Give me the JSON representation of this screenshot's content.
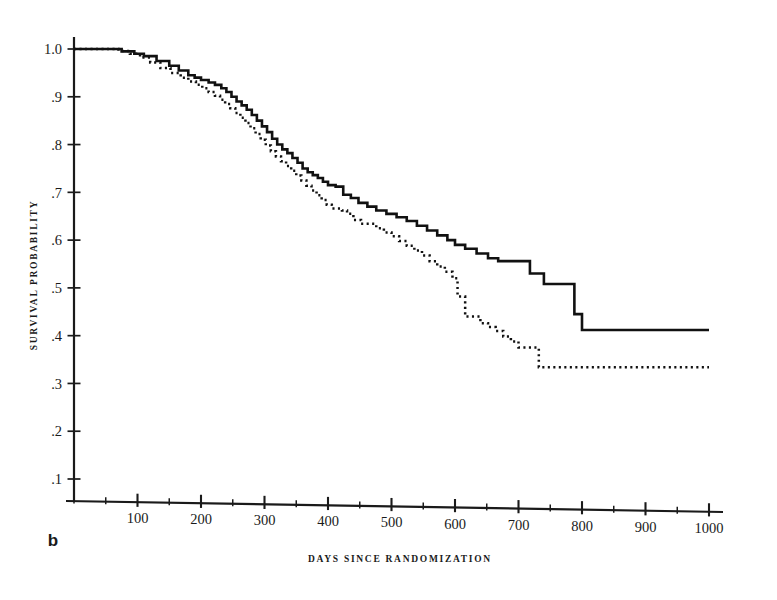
{
  "figure": {
    "panel_label": "b",
    "background_color": "#ffffff",
    "ink_color": "#1a1a1a"
  },
  "chart_data": {
    "type": "line",
    "title": "",
    "subtitle": "",
    "xlabel": "DAYS SINCE RANDOMIZATION",
    "ylabel": "SURVIVAL PROBABILITY",
    "xlim": [
      0,
      1000
    ],
    "ylim": [
      0.0,
      1.02
    ],
    "grid": false,
    "legend_position": "none",
    "plot_style": "kaplan-meier step curves, no top or right frame",
    "xticks": [
      0,
      50,
      100,
      150,
      200,
      250,
      300,
      350,
      400,
      450,
      500,
      550,
      600,
      650,
      700,
      750,
      800,
      850,
      900,
      950,
      1000
    ],
    "xtick_labels": [
      "",
      "",
      "100",
      "",
      "200",
      "",
      "300",
      "",
      "400",
      "",
      "500",
      "",
      "600",
      "",
      "700",
      "",
      "800",
      "",
      "900",
      "",
      "1000"
    ],
    "xtick_major": [
      100,
      200,
      300,
      400,
      500,
      600,
      700,
      800,
      900,
      1000
    ],
    "yticks": [
      0.1,
      0.2,
      0.3,
      0.4,
      0.5,
      0.6,
      0.7,
      0.8,
      0.9,
      1.0
    ],
    "ytick_labels": [
      ".1",
      ".2",
      ".3",
      ".4",
      ".5",
      ".6",
      ".7",
      ".8",
      ".9",
      "1.0"
    ],
    "series": [
      {
        "name": "solid-curve",
        "style": "solid",
        "step_type": "post",
        "x": [
          0,
          55,
          75,
          95,
          110,
          130,
          150,
          165,
          180,
          190,
          200,
          212,
          222,
          232,
          240,
          248,
          256,
          264,
          272,
          280,
          288,
          296,
          304,
          312,
          320,
          328,
          336,
          344,
          352,
          360,
          368,
          376,
          384,
          392,
          400,
          412,
          424,
          436,
          448,
          462,
          476,
          492,
          508,
          524,
          540,
          556,
          572,
          588,
          600,
          616,
          634,
          652,
          668,
          684,
          700,
          718,
          740,
          762,
          788,
          800,
          1000
        ],
        "y": [
          1.0,
          1.0,
          0.995,
          0.99,
          0.985,
          0.975,
          0.965,
          0.955,
          0.945,
          0.94,
          0.935,
          0.93,
          0.925,
          0.918,
          0.91,
          0.9,
          0.89,
          0.882,
          0.873,
          0.862,
          0.85,
          0.838,
          0.826,
          0.812,
          0.8,
          0.79,
          0.782,
          0.772,
          0.762,
          0.75,
          0.742,
          0.736,
          0.73,
          0.722,
          0.715,
          0.712,
          0.695,
          0.688,
          0.678,
          0.67,
          0.662,
          0.655,
          0.648,
          0.64,
          0.63,
          0.62,
          0.61,
          0.6,
          0.59,
          0.582,
          0.572,
          0.562,
          0.556,
          0.556,
          0.556,
          0.53,
          0.508,
          0.508,
          0.445,
          0.412,
          0.412
        ]
      },
      {
        "name": "dotted-curve",
        "style": "dotted",
        "step_type": "post",
        "x": [
          0,
          50,
          70,
          88,
          104,
          120,
          136,
          152,
          168,
          180,
          192,
          202,
          212,
          222,
          230,
          238,
          246,
          254,
          262,
          270,
          278,
          286,
          294,
          302,
          310,
          318,
          326,
          334,
          342,
          350,
          358,
          366,
          374,
          382,
          390,
          398,
          406,
          414,
          422,
          430,
          440,
          452,
          464,
          476,
          488,
          500,
          512,
          524,
          536,
          548,
          560,
          572,
          584,
          596,
          604,
          616,
          628,
          640,
          652,
          664,
          676,
          688,
          700,
          716,
          732,
          740,
          1000
        ],
        "y": [
          1.0,
          1.0,
          0.996,
          0.99,
          0.982,
          0.972,
          0.96,
          0.95,
          0.94,
          0.932,
          0.925,
          0.918,
          0.91,
          0.902,
          0.894,
          0.885,
          0.876,
          0.866,
          0.856,
          0.845,
          0.834,
          0.822,
          0.81,
          0.798,
          0.786,
          0.775,
          0.765,
          0.755,
          0.745,
          0.735,
          0.725,
          0.714,
          0.704,
          0.694,
          0.684,
          0.674,
          0.666,
          0.666,
          0.662,
          0.655,
          0.642,
          0.634,
          0.634,
          0.625,
          0.616,
          0.608,
          0.598,
          0.588,
          0.578,
          0.568,
          0.556,
          0.545,
          0.534,
          0.52,
          0.482,
          0.44,
          0.44,
          0.426,
          0.418,
          0.41,
          0.398,
          0.388,
          0.375,
          0.375,
          0.334,
          0.334,
          0.334
        ]
      }
    ],
    "annotations": [
      {
        "name": "panel-label",
        "text": "b",
        "x_px": 53,
        "y_px": 546
      }
    ]
  }
}
